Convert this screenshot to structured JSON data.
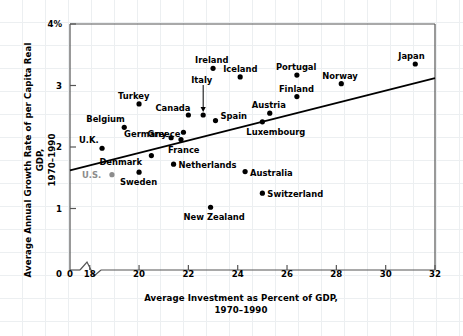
{
  "chart_data": {
    "type": "scatter",
    "title": "",
    "xlabel": "Average Investment as Percent of GDP, 1970–1990",
    "xlabel_line1": "Average Investment as Percent of GDP,",
    "xlabel_line2": "1970–1990",
    "ylabel": "Average Annual Growth Rate of per Capita Real GDP, 1970–1990",
    "ylabel_line1": "Average Annual Growth Rate of per Capita Real GDP,",
    "ylabel_line2": "1970–1990",
    "xlim": [
      17.2,
      32.0
    ],
    "ylim": [
      0,
      4
    ],
    "xticks": [
      "18",
      "20",
      "22",
      "24",
      "26",
      "28",
      "30",
      "32"
    ],
    "xtick_values": [
      18,
      20,
      22,
      24,
      26,
      28,
      30,
      32
    ],
    "yticks": [
      "0",
      "1",
      "2",
      "3",
      "4%"
    ],
    "ytick_values": [
      0,
      1,
      2,
      3,
      4
    ],
    "origin_tick_label": "0",
    "axis_break": true,
    "grid": false,
    "legend": "none",
    "marker_color": "#000000",
    "highlight_color": "#8c8c8c",
    "trendline": {
      "label": "fitted trend line",
      "x_start": 17.2,
      "y_start": 1.62,
      "x_end": 32.0,
      "y_end": 3.12
    },
    "points": [
      {
        "name": "U.K.",
        "x": 18.5,
        "y": 1.98,
        "label_dx": -23,
        "label_dy": -13,
        "color": "#000000"
      },
      {
        "name": "U.S.",
        "x": 18.9,
        "y": 1.55,
        "label_dx": -30,
        "label_dy": -5,
        "color": "#8c8c8c"
      },
      {
        "name": "Belgium",
        "x": 19.4,
        "y": 2.32,
        "label_dx": -38,
        "label_dy": -13,
        "color": "#000000"
      },
      {
        "name": "Turkey",
        "x": 20.0,
        "y": 2.7,
        "label_dx": -21,
        "label_dy": -13,
        "color": "#000000"
      },
      {
        "name": "Sweden",
        "x": 20.0,
        "y": 1.59,
        "label_dx": -19,
        "label_dy": 5,
        "color": "#000000"
      },
      {
        "name": "Denmark",
        "x": 20.5,
        "y": 1.86,
        "label_dx": -52,
        "label_dy": 1,
        "color": "#000000"
      },
      {
        "name": "Germany",
        "x": 21.3,
        "y": 2.15,
        "label_dx": -47,
        "label_dy": -9,
        "color": "#000000"
      },
      {
        "name": "Netherlands",
        "x": 21.4,
        "y": 1.72,
        "label_dx": 5,
        "label_dy": -4,
        "color": "#000000"
      },
      {
        "name": "Greece",
        "x": 21.8,
        "y": 2.24,
        "label_dx": -36,
        "label_dy": -3,
        "color": "#000000"
      },
      {
        "name": "France",
        "x": 21.7,
        "y": 2.12,
        "label_dx": -13,
        "label_dy": 5,
        "color": "#000000"
      },
      {
        "name": "Canada",
        "x": 22.0,
        "y": 2.52,
        "label_dx": -33,
        "label_dy": -12,
        "color": "#000000"
      },
      {
        "name": "Italy",
        "x": 22.6,
        "y": 2.52,
        "label_dx": -12,
        "label_dy": -40,
        "color": "#000000",
        "leader": true
      },
      {
        "name": "Ireland",
        "x": 23.0,
        "y": 3.28,
        "label_dx": -18,
        "label_dy": -13,
        "color": "#000000"
      },
      {
        "name": "New Zealand",
        "x": 22.9,
        "y": 1.02,
        "label_dx": -27,
        "label_dy": 5,
        "color": "#000000"
      },
      {
        "name": "Spain",
        "x": 23.1,
        "y": 2.43,
        "label_dx": 5,
        "label_dy": -10,
        "color": "#000000"
      },
      {
        "name": "Iceland",
        "x": 24.1,
        "y": 3.14,
        "label_dx": -17,
        "label_dy": -13,
        "color": "#000000"
      },
      {
        "name": "Australia",
        "x": 24.3,
        "y": 1.6,
        "label_dx": 5,
        "label_dy": -4,
        "color": "#000000"
      },
      {
        "name": "Luxembourg",
        "x": 25.0,
        "y": 2.41,
        "label_dx": -16,
        "label_dy": 5,
        "color": "#000000"
      },
      {
        "name": "Switzerland",
        "x": 25.0,
        "y": 1.25,
        "label_dx": 5,
        "label_dy": -4,
        "color": "#000000"
      },
      {
        "name": "Austria",
        "x": 25.3,
        "y": 2.55,
        "label_dx": -18,
        "label_dy": -13,
        "color": "#000000"
      },
      {
        "name": "Finland",
        "x": 26.4,
        "y": 2.82,
        "label_dx": -18,
        "label_dy": -13,
        "color": "#000000"
      },
      {
        "name": "Portugal",
        "x": 26.4,
        "y": 3.17,
        "label_dx": -21,
        "label_dy": -13,
        "color": "#000000"
      },
      {
        "name": "Norway",
        "x": 28.2,
        "y": 3.03,
        "label_dx": -19,
        "label_dy": -13,
        "color": "#000000"
      },
      {
        "name": "Japan",
        "x": 31.2,
        "y": 3.35,
        "label_dx": -17,
        "label_dy": -13,
        "color": "#000000"
      }
    ]
  }
}
